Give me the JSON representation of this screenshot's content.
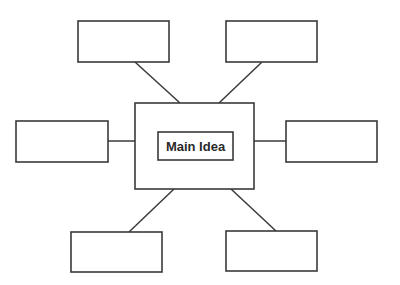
{
  "diagram": {
    "type": "concept-map",
    "center": {
      "outer_label": "",
      "inner_label": "Main Idea"
    },
    "satellites": [
      {
        "position": "top-left",
        "label": ""
      },
      {
        "position": "top-right",
        "label": ""
      },
      {
        "position": "left",
        "label": ""
      },
      {
        "position": "right",
        "label": ""
      },
      {
        "position": "bottom-left",
        "label": ""
      },
      {
        "position": "bottom-right",
        "label": ""
      }
    ],
    "colors": {
      "stroke": "#3a3a3a",
      "background": "#ffffff",
      "text": "#2a2a2a"
    }
  }
}
